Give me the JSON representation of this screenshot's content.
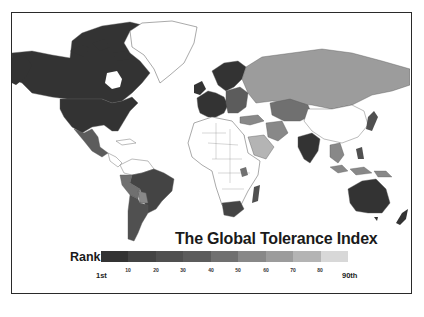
{
  "title": "The Global Tolerance Index",
  "legend": {
    "label": "Rank",
    "start_label": "1st",
    "end_label": "90th",
    "ticks": [
      "10",
      "20",
      "30",
      "40",
      "50",
      "60",
      "70",
      "80"
    ],
    "colors": [
      "#333333",
      "#444444",
      "#505050",
      "#5c5c5c",
      "#707070",
      "#888888",
      "#9c9c9c",
      "#b4b4b4",
      "#d8d8d8"
    ]
  },
  "map": {
    "no_data_color": "#ffffff",
    "border_color": "#555555",
    "regions": [
      {
        "name": "Canada",
        "shade": "#333333"
      },
      {
        "name": "United States",
        "shade": "#333333"
      },
      {
        "name": "Mexico",
        "shade": "#5c5c5c"
      },
      {
        "name": "Brazil",
        "shade": "#444444"
      },
      {
        "name": "Peru",
        "shade": "#707070"
      },
      {
        "name": "Argentina",
        "shade": "#505050"
      },
      {
        "name": "Western Europe",
        "shade": "#333333"
      },
      {
        "name": "Scandinavia",
        "shade": "#333333"
      },
      {
        "name": "Russia",
        "shade": "#9c9c9c"
      },
      {
        "name": "Kazakhstan",
        "shade": "#707070"
      },
      {
        "name": "India",
        "shade": "#333333"
      },
      {
        "name": "Australia",
        "shade": "#333333"
      },
      {
        "name": "South Africa",
        "shade": "#444444"
      },
      {
        "name": "Madagascar",
        "shade": "#505050"
      },
      {
        "name": "Indonesia",
        "shade": "#888888"
      },
      {
        "name": "Philippines",
        "shade": "#505050"
      },
      {
        "name": "Japan",
        "shade": "#505050"
      },
      {
        "name": "New Zealand",
        "shade": "#333333"
      }
    ]
  }
}
